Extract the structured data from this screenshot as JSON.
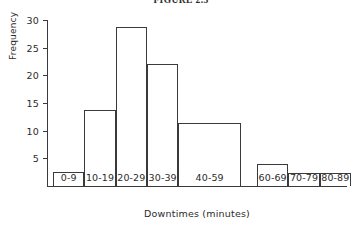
{
  "figure": {
    "caption": "FIGURE 2.3"
  },
  "chart_data": {
    "type": "bar",
    "title": "FIGURE 2.3",
    "xlabel": "Downtimes (minutes)",
    "ylabel": "Frequency",
    "categories": [
      "0-9",
      "10-19",
      "20-29",
      "30-39",
      "40-59",
      "60-69",
      "70-79",
      "80-89"
    ],
    "values": [
      2.6,
      13.7,
      28.7,
      22.0,
      11.3,
      3.9,
      2.4,
      2.3
    ],
    "bin_widths": [
      1,
      1,
      1,
      1,
      2,
      1,
      1,
      1
    ],
    "ylim": [
      0,
      30
    ],
    "xlim": [
      0,
      9
    ],
    "yticks": [
      5,
      10,
      15,
      20,
      25,
      30
    ],
    "ytick_labels": [
      "5",
      "10",
      "15",
      "20",
      "25",
      "30"
    ],
    "grid": false,
    "legend": false,
    "bar_style": {
      "fill": "none",
      "edge_color": "#3a3a3a"
    }
  }
}
